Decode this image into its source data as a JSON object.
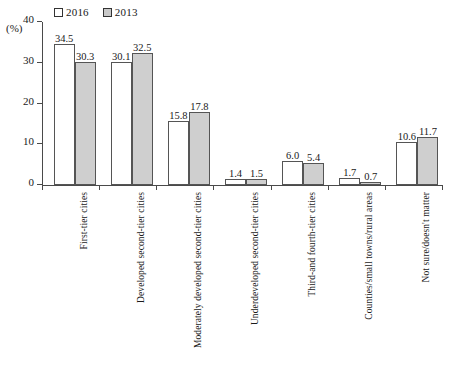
{
  "chart_data": {
    "type": "bar",
    "title": "",
    "xlabel": "",
    "ylabel": "(%)",
    "ylim": [
      0,
      40
    ],
    "yticks": [
      0,
      10,
      20,
      30,
      40
    ],
    "grid": false,
    "legend_position": "top-left",
    "categories": [
      "First-tier cities",
      "Developed second-tier cities",
      "Moderately developed second-tier cities",
      "Underdeveloped second-tier cities",
      "Third-and fourth-tier cities",
      "Counties/small towns/rural areas",
      "Not sure/doesn't matter"
    ],
    "series": [
      {
        "name": "2016",
        "color": "#ffffff",
        "values": [
          34.5,
          30.1,
          15.8,
          1.4,
          6.0,
          1.7,
          10.6
        ],
        "value_labels": [
          "34.5",
          "30.1",
          "15.8",
          "1.4",
          "6.0",
          "1.7",
          "10.6"
        ]
      },
      {
        "name": "2013",
        "color": "#cfcfcf",
        "values": [
          30.3,
          32.5,
          17.8,
          1.5,
          5.4,
          0.7,
          11.7
        ],
        "value_labels": [
          "30.3",
          "32.5",
          "17.8",
          "1.5",
          "5.4",
          "0.7",
          "11.7"
        ]
      }
    ]
  },
  "axis": {
    "unit": "(%)",
    "tick_labels": [
      "0",
      "10",
      "20",
      "30",
      "40"
    ]
  },
  "legend": {
    "entries": [
      {
        "label": "2016"
      },
      {
        "label": "2013"
      }
    ]
  }
}
